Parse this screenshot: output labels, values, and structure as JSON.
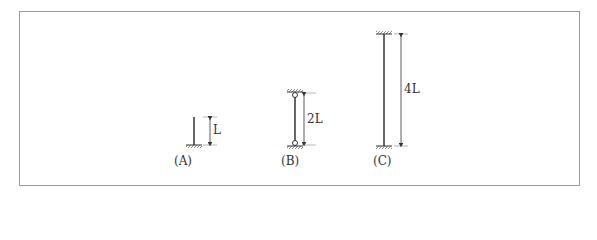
{
  "figure": {
    "columns": [
      {
        "id": "A",
        "caption": "(A)",
        "length_label": "L",
        "support_top": "free",
        "support_bottom": "fixed"
      },
      {
        "id": "B",
        "caption": "(B)",
        "length_label": "2L",
        "support_top": "pinned",
        "support_bottom": "pinned"
      },
      {
        "id": "C",
        "caption": "(C)",
        "length_label": "4L",
        "support_top": "fixed",
        "support_bottom": "fixed"
      }
    ]
  }
}
